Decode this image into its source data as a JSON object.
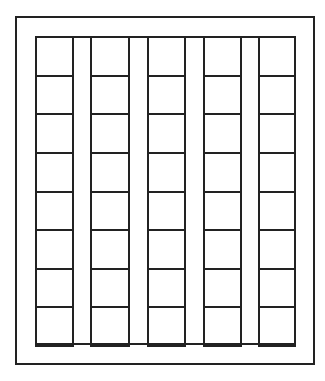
{
  "diagram": {
    "type": "grid-frame",
    "outer_frame": {
      "x": 15,
      "y": 16,
      "width": 298,
      "height": 347
    },
    "inner_grid": {
      "x": 35,
      "y": 36,
      "width": 261,
      "height": 309
    },
    "columns": [
      {
        "index": 1,
        "x": 35,
        "width": 37
      },
      {
        "index": 2,
        "x": 90,
        "width": 38
      },
      {
        "index": 3,
        "x": 147,
        "width": 37
      },
      {
        "index": 4,
        "x": 203,
        "width": 37
      },
      {
        "index": 5,
        "x": 258,
        "width": 36
      }
    ],
    "rows_per_column": 8,
    "column_count": 5,
    "line_color": "#222222",
    "background_color": "#ffffff"
  }
}
